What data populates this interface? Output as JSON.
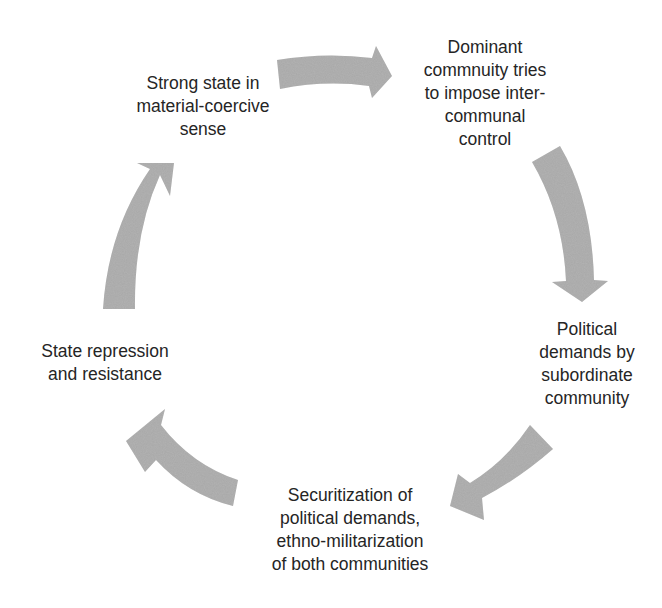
{
  "diagram": {
    "type": "cycle",
    "arrow_color": "#a3a3a3",
    "nodes": [
      {
        "id": "n1",
        "label": "Strong state in\nmaterial-coercive\nsense"
      },
      {
        "id": "n2",
        "label": "Dominant\ncommnuity tries\nto impose inter-\ncommunal\ncontrol"
      },
      {
        "id": "n3",
        "label": "Political\ndemands by\nsubordinate\ncommunity"
      },
      {
        "id": "n4",
        "label": "Securitization of\npolitical demands,\nethno-militarization\nof both communities"
      },
      {
        "id": "n5",
        "label": "State repression\nand resistance"
      }
    ],
    "edges": [
      {
        "from": "n1",
        "to": "n2"
      },
      {
        "from": "n2",
        "to": "n3"
      },
      {
        "from": "n3",
        "to": "n4"
      },
      {
        "from": "n4",
        "to": "n5"
      },
      {
        "from": "n5",
        "to": "n1"
      }
    ]
  }
}
